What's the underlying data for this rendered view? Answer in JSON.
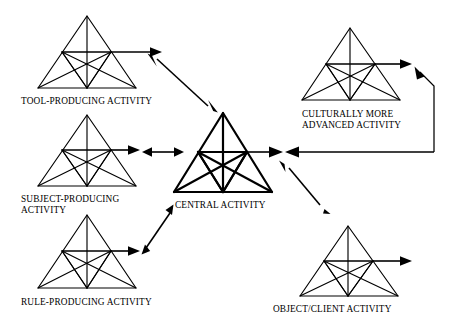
{
  "diagram": {
    "type": "node-link-diagram",
    "background_color": "#ffffff",
    "line_color": "#000000",
    "nodes": [
      {
        "id": "tool",
        "label": "TOOL-PRODUCING ACTIVITY",
        "label_lines": [
          "TOOL-PRODUCING ACTIVITY"
        ],
        "emphasis": "normal",
        "position": "top-left"
      },
      {
        "id": "subject",
        "label": "SUBJECT-PRODUCING ACTIVITY",
        "label_lines": [
          "SUBJECT-PRODUCING",
          "ACTIVITY"
        ],
        "emphasis": "normal",
        "position": "middle-left"
      },
      {
        "id": "rule",
        "label": "RULE-PRODUCING ACTIVITY",
        "label_lines": [
          "RULE-PRODUCING ACTIVITY"
        ],
        "emphasis": "normal",
        "position": "bottom-left"
      },
      {
        "id": "central",
        "label": "CENTRAL ACTIVITY",
        "label_lines": [
          "CENTRAL ACTIVITY"
        ],
        "emphasis": "bold",
        "position": "center"
      },
      {
        "id": "cultural",
        "label": "CULTURALLY MORE ADVANCED ACTIVITY",
        "label_lines": [
          "CULTURALLY MORE",
          "ADVANCED ACTIVITY"
        ],
        "emphasis": "normal",
        "position": "top-right"
      },
      {
        "id": "object",
        "label": "OBJECT/CLIENT ACTIVITY",
        "label_lines": [
          "OBJECT/CLIENT ACTIVITY"
        ],
        "emphasis": "normal",
        "position": "bottom-right"
      }
    ],
    "connections": [
      {
        "id": "tool-central",
        "from": "tool",
        "to": "central",
        "style": "double-headed-diagonal"
      },
      {
        "id": "subject-central",
        "from": "subject",
        "to": "central",
        "style": "double-headed-horizontal"
      },
      {
        "id": "rule-central",
        "from": "rule",
        "to": "central",
        "style": "double-headed-diagonal"
      },
      {
        "id": "central-object",
        "from": "central",
        "to": "object",
        "style": "double-headed-diagonal"
      },
      {
        "id": "cultural-central",
        "from": "cultural",
        "to": "central",
        "style": "single-headed-elbow"
      },
      {
        "id": "outcome-cultural",
        "from": "central",
        "to": "cultural",
        "style": "single-headed-elbow"
      }
    ],
    "node_internal_arrow": "outcome-arrow-right"
  }
}
